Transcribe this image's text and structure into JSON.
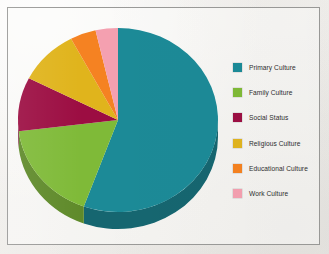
{
  "figure": {
    "background_color": "#f1efec",
    "frame_color": "#9a9a98"
  },
  "chart_data": {
    "type": "pie",
    "title": "",
    "subtitle": "",
    "xlabel": "",
    "ylabel": "",
    "grid": false,
    "legend_position": "right",
    "three_d": true,
    "start_angle_oclock": 12,
    "direction": "clockwise",
    "categories": [
      "Primary Culture",
      "Family Culture",
      "Social Status",
      "Religious Culture",
      "Educational Culture",
      "Work Culture"
    ],
    "values": [
      55.6,
      17.5,
      9.4,
      9.7,
      4.2,
      3.5
    ],
    "angles_deg": [
      200,
      63,
      34,
      35,
      15,
      13
    ],
    "colors": [
      "#1b8a97",
      "#7fba37",
      "#9c0f43",
      "#e0b41f",
      "#f58220",
      "#f4a0b0"
    ],
    "slice_labels_visible": false
  },
  "legend": {
    "items": [
      {
        "label": "Primary Culture",
        "color": "#1b8a97"
      },
      {
        "label": "Family Culture",
        "color": "#7fba37"
      },
      {
        "label": "Social Status",
        "color": "#9c0f43"
      },
      {
        "label": "Religious Culture",
        "color": "#e0b41f"
      },
      {
        "label": "Educational Culture",
        "color": "#f58220"
      },
      {
        "label": "Work Culture",
        "color": "#f4a0b0"
      }
    ]
  }
}
